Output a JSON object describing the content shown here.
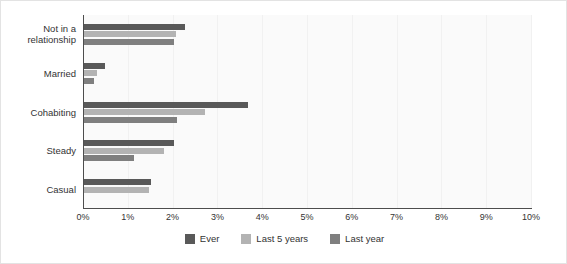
{
  "chart_data": {
    "type": "bar",
    "orientation": "horizontal",
    "title": "",
    "subtitle": "",
    "xlabel": "",
    "ylabel": "",
    "xlim": [
      0,
      10
    ],
    "xunit": "%",
    "grid": true,
    "legend_position": "bottom",
    "categories": [
      "Not in a relationship",
      "Married",
      "Cohabiting",
      "Steady",
      "Casual"
    ],
    "category_labels_wrapped": [
      [
        "Not in a",
        "relationship"
      ],
      [
        "Married"
      ],
      [
        "Cohabiting"
      ],
      [
        "Steady"
      ],
      [
        "Casual"
      ]
    ],
    "xticks": [
      "0%",
      "1%",
      "2%",
      "3%",
      "4%",
      "5%",
      "6%",
      "7%",
      "8%",
      "9%",
      "10%"
    ],
    "xtick_values": [
      0,
      1,
      2,
      3,
      4,
      5,
      6,
      7,
      8,
      9,
      10
    ],
    "series": [
      {
        "name": "Ever",
        "color": "#595959",
        "values": [
          2.25,
          0.47,
          3.65,
          2.0,
          1.5
        ]
      },
      {
        "name": "Last 5 years",
        "color": "#b3b3b3",
        "values": [
          2.05,
          0.3,
          2.7,
          1.78,
          1.45
        ]
      },
      {
        "name": "Last year",
        "color": "#7f7f7f",
        "values": [
          2.02,
          0.22,
          2.08,
          1.12,
          0
        ]
      }
    ]
  },
  "legend": {
    "items": [
      {
        "label": "Ever",
        "color": "#595959"
      },
      {
        "label": "Last 5 years",
        "color": "#b3b3b3"
      },
      {
        "label": "Last year",
        "color": "#7f7f7f"
      }
    ]
  }
}
